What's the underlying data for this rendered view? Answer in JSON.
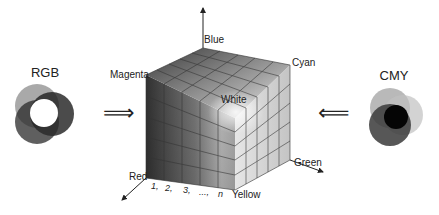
{
  "left_model": {
    "title": "RGB"
  },
  "right_model": {
    "title": "CMY"
  },
  "cube": {
    "corners": {
      "blue": "Blue",
      "magenta": "Magenta",
      "cyan": "Cyan",
      "white": "White",
      "red": "Red",
      "green": "Green",
      "yellow": "Yellow"
    },
    "index_labels": [
      "1,",
      "2,",
      "3,",
      "...,",
      "n"
    ]
  },
  "arrows": {
    "left": "⟹",
    "right": "⟸"
  },
  "colors": {
    "stroke": "#222222",
    "background": "#ffffff"
  }
}
